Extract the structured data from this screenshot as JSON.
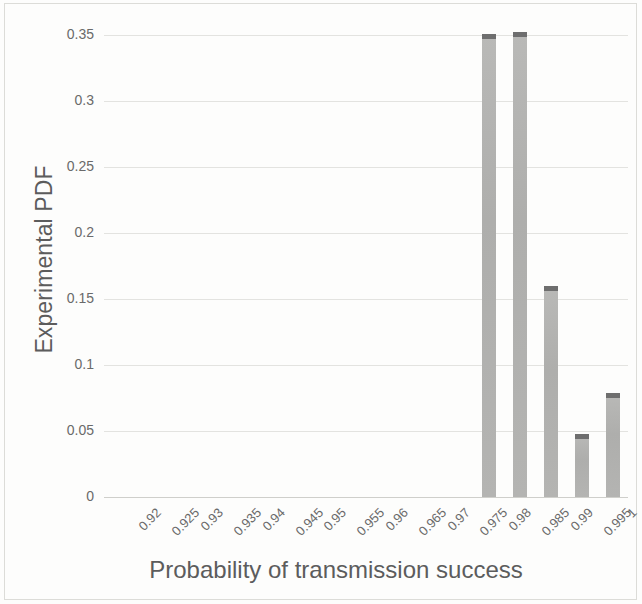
{
  "chart_data": {
    "type": "bar",
    "title": "",
    "xlabel": "Probability of transmission success",
    "ylabel": "Experimental PDF",
    "categories": [
      "0.92",
      "0.925",
      "0.93",
      "0.935",
      "0.94",
      "0.945",
      "0.95",
      "0.955",
      "0.96",
      "0.965",
      "0.97",
      "0.975",
      "0.98",
      "0.985",
      "0.99",
      "0.995",
      "1"
    ],
    "values": [
      0,
      0,
      0,
      0,
      0,
      0,
      0,
      0,
      0,
      0,
      0,
      0,
      0.351,
      0.352,
      0.16,
      0.048,
      0.079
    ],
    "ylim": [
      0,
      0.35
    ],
    "yticks": [
      0,
      0.05,
      0.1,
      0.15,
      0.2,
      0.25,
      0.3,
      0.35
    ],
    "ytick_labels": [
      "0",
      "0.05",
      "0.1",
      "0.15",
      "0.2",
      "0.25",
      "0.3",
      "0.35"
    ],
    "grid": true,
    "legend": false,
    "legend_position": "none",
    "colors": {
      "bar_fill": "#b2b2b0",
      "bar_cap": "#6e6e6e",
      "gridline": "#e3e3e0",
      "axis_line": "#cfcfcb",
      "text": "#5c5c5c",
      "tick_text": "#6a6a6a",
      "background": "#fdfdfc",
      "page_border": "#dcdcd8"
    }
  }
}
